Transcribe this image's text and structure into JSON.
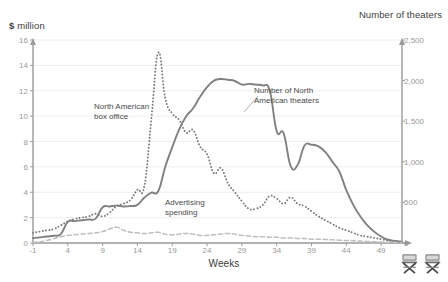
{
  "chart_data": {
    "type": "line",
    "title": "",
    "xlabel": "Weeks",
    "ylabel": "$ million",
    "ylabel_right": "Number of theaters",
    "xlim": [
      -1,
      52
    ],
    "ylim": [
      0,
      16
    ],
    "ylim_right": [
      0,
      2500
    ],
    "grid": true,
    "legend_position": "inline-annotations",
    "y_ticks": [
      "0",
      "2",
      "4",
      "6",
      "8",
      "10",
      "12",
      "14",
      "16"
    ],
    "y_tick_values": [
      0,
      2,
      4,
      6,
      8,
      10,
      12,
      14,
      16
    ],
    "y_ticks_right": [
      "0",
      "500",
      "1,000",
      "1,500",
      "2,000",
      "2,500"
    ],
    "y_tick_values_right": [
      0,
      500,
      1000,
      1500,
      2000,
      2500
    ],
    "x_ticks": [
      "-1",
      "4",
      "9",
      "14",
      "19",
      "24",
      "29",
      "34",
      "39",
      "44",
      "49"
    ],
    "x_tick_values": [
      -1,
      4,
      9,
      14,
      19,
      24,
      29,
      34,
      39,
      44,
      49
    ],
    "x": [
      -1,
      0,
      1,
      2,
      3,
      4,
      5,
      6,
      7,
      8,
      9,
      10,
      11,
      12,
      13,
      14,
      15,
      16,
      17,
      18,
      19,
      20,
      21,
      22,
      23,
      24,
      25,
      26,
      27,
      28,
      29,
      30,
      31,
      32,
      33,
      34,
      35,
      36,
      37,
      38,
      39,
      40,
      41,
      42,
      43,
      44,
      45,
      46,
      47,
      48,
      49,
      50,
      51,
      52
    ],
    "series": [
      {
        "name": "North American box office",
        "axis": "left",
        "units": "$ million",
        "style": "dotted",
        "color": "#7a7a7a",
        "values": [
          0.8,
          0.9,
          1.0,
          1.1,
          1.4,
          1.7,
          1.9,
          2.0,
          2.1,
          2.3,
          2.1,
          2.4,
          2.9,
          3.1,
          3.4,
          4.2,
          4.5,
          9.8,
          15.0,
          11.4,
          10.2,
          9.7,
          8.7,
          8.9,
          7.6,
          7.0,
          5.5,
          5.9,
          4.7,
          4.0,
          3.3,
          2.7,
          2.7,
          3.0,
          3.7,
          3.5,
          3.1,
          3.6,
          3.1,
          2.9,
          2.5,
          2.1,
          1.8,
          1.5,
          1.2,
          1.0,
          0.8,
          0.6,
          0.5,
          0.4,
          0.3,
          0.2,
          0.15,
          0.1
        ]
      },
      {
        "name": "Number of North American theaters",
        "axis": "right",
        "units": "theaters",
        "style": "solid",
        "color": "#808080",
        "values": [
          60,
          70,
          80,
          90,
          110,
          260,
          270,
          280,
          290,
          300,
          440,
          450,
          460,
          450,
          455,
          470,
          560,
          620,
          640,
          940,
          1180,
          1400,
          1560,
          1660,
          1800,
          1920,
          2000,
          2020,
          2010,
          1995,
          1950,
          1960,
          1950,
          1940,
          1880,
          1380,
          1350,
          950,
          960,
          1200,
          1210,
          1190,
          1120,
          1000,
          880,
          650,
          470,
          330,
          220,
          140,
          80,
          40,
          25,
          15
        ]
      },
      {
        "name": "Advertising spending",
        "axis": "left",
        "units": "$ million",
        "style": "dashed",
        "color": "#bfbfbf",
        "values": [
          0.05,
          0.1,
          0.2,
          0.35,
          0.5,
          0.6,
          0.65,
          0.7,
          0.75,
          0.8,
          0.9,
          1.1,
          1.25,
          1.0,
          0.85,
          0.8,
          0.75,
          0.8,
          0.85,
          0.7,
          0.65,
          0.7,
          0.75,
          0.7,
          0.6,
          0.6,
          0.65,
          0.7,
          0.75,
          0.7,
          0.6,
          0.55,
          0.5,
          0.5,
          0.45,
          0.45,
          0.4,
          0.4,
          0.35,
          0.35,
          0.3,
          0.3,
          0.28,
          0.25,
          0.22,
          0.2,
          0.18,
          0.15,
          0.12,
          0.1,
          0.08,
          0.06,
          0.05,
          0.04
        ]
      }
    ],
    "annotations": [
      {
        "id": "box-office",
        "text_line1": "North American",
        "text_line2": "box office"
      },
      {
        "id": "theaters",
        "text_line1": "Number of North",
        "text_line2": "American theaters"
      },
      {
        "id": "advertising",
        "text_line1": "Advertising",
        "text_line2": "spending"
      }
    ],
    "icons": [
      "directors-chair-icon",
      "directors-chair-icon"
    ]
  },
  "axes": {
    "left_title_symbol": "$",
    "left_title_unit": "million",
    "right_title": "Number of theaters",
    "x_title": "Weeks"
  },
  "colors": {
    "background": "#ffffff",
    "axis": "#9a9a9a",
    "grid": "#eeeeee",
    "box_office": "#7a7a7a",
    "theaters": "#808080",
    "advertising": "#bfbfbf",
    "text": "#58595b"
  }
}
